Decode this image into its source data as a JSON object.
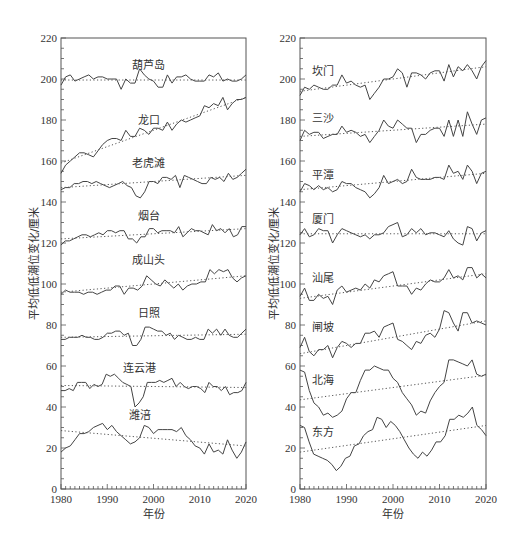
{
  "chart_data": [
    {
      "type": "line",
      "panel": "left",
      "xlabel": "年份",
      "ylabel": "平均低低潮位变化/厘米",
      "xlim": [
        1980,
        2020
      ],
      "ylim": [
        0,
        220
      ],
      "xticks": [
        1980,
        1990,
        2000,
        2010,
        2020
      ],
      "yticks": [
        0,
        20,
        40,
        60,
        80,
        100,
        120,
        140,
        160,
        180,
        200,
        220
      ],
      "grid": false,
      "x": [
        1980,
        1981,
        1982,
        1983,
        1984,
        1985,
        1986,
        1987,
        1988,
        1989,
        1990,
        1991,
        1992,
        1993,
        1994,
        1995,
        1996,
        1997,
        1998,
        1999,
        2000,
        2001,
        2002,
        2003,
        2004,
        2005,
        2006,
        2007,
        2008,
        2009,
        2010,
        2011,
        2012,
        2013,
        2014,
        2015,
        2016,
        2017,
        2018,
        2019,
        2020
      ],
      "series": [
        {
          "name": "葫芦岛",
          "label_pos": [
            1999,
            205
          ],
          "trend": [
            199.5,
            199.5
          ],
          "values": [
            197,
            201,
            202,
            199,
            200,
            201,
            202,
            200,
            201,
            201,
            200,
            200,
            200,
            195,
            200,
            198,
            198,
            205,
            202,
            200,
            199,
            196,
            196,
            202,
            198,
            201,
            201,
            202,
            200,
            199,
            199,
            199,
            202,
            201,
            203,
            199,
            200,
            199,
            199,
            200,
            202
          ]
        },
        {
          "name": "龙口",
          "label_pos": [
            1999,
            178
          ],
          "trend": [
            159,
            191
          ],
          "values": [
            154,
            158,
            160,
            162,
            164,
            164,
            163,
            162,
            165,
            168,
            170,
            171,
            171,
            170,
            175,
            172,
            172,
            176,
            175,
            173,
            176,
            176,
            175,
            179,
            175,
            178,
            180,
            179,
            180,
            181,
            182,
            187,
            186,
            188,
            187,
            191,
            185,
            188,
            190,
            190,
            191
          ]
        },
        {
          "name": "老虎滩",
          "label_pos": [
            1999,
            157
          ],
          "trend": [
            147,
            153
          ],
          "values": [
            146,
            147,
            147,
            149,
            149,
            150,
            150,
            149,
            150,
            149,
            148,
            147,
            148,
            149,
            150,
            148,
            147,
            143,
            142,
            145,
            150,
            150,
            149,
            152,
            152,
            151,
            153,
            147,
            153,
            152,
            151,
            150,
            149,
            149,
            152,
            151,
            152,
            150,
            154,
            151,
            152,
            154,
            156
          ]
        },
        {
          "name": "烟台",
          "label_pos": [
            1999,
            131
          ],
          "trend": [
            122,
            127
          ],
          "values": [
            119,
            121,
            121,
            122,
            123,
            124,
            124,
            123,
            124,
            125,
            124,
            126,
            126,
            125,
            126,
            126,
            122,
            122,
            120,
            123,
            123,
            127,
            127,
            125,
            126,
            126,
            126,
            125,
            128,
            123,
            125,
            127,
            126,
            126,
            125,
            124,
            129,
            126,
            127,
            125,
            127,
            123,
            124,
            128,
            128
          ]
        },
        {
          "name": "成山头",
          "label_pos": [
            1999,
            110
          ],
          "trend": [
            96,
            104
          ],
          "values": [
            95,
            97,
            96,
            96,
            96,
            95,
            96,
            96,
            95,
            96,
            97,
            97,
            99,
            99,
            95,
            98,
            98,
            97,
            99,
            104,
            102,
            100,
            99,
            102,
            100,
            98,
            100,
            97,
            99,
            100,
            100,
            101,
            101,
            107,
            105,
            107,
            106,
            107,
            103,
            101,
            103,
            104
          ]
        },
        {
          "name": "日照",
          "label_pos": [
            1999,
            84
          ],
          "trend": [
            74,
            75.5
          ],
          "values": [
            73,
            73,
            74,
            74,
            74,
            75,
            74,
            74,
            73,
            73,
            74,
            76,
            76,
            77,
            77,
            75,
            76,
            70,
            70,
            73,
            79,
            79,
            78,
            77,
            77,
            75,
            76,
            73,
            75,
            74,
            73,
            73,
            74,
            73,
            73,
            78,
            76,
            78,
            75,
            78,
            75,
            74,
            74,
            76,
            78
          ]
        },
        {
          "name": "连云港",
          "label_pos": [
            1997,
            57
          ],
          "trend": [
            50.5,
            49.5
          ],
          "values": [
            48,
            48,
            49,
            48,
            52,
            52,
            52,
            49,
            51,
            50,
            51,
            56,
            55,
            56,
            54,
            52,
            51,
            50,
            40,
            42,
            45,
            52,
            52,
            52,
            53,
            52,
            53,
            54,
            50,
            52,
            50,
            49,
            50,
            50,
            49,
            47,
            52,
            50,
            50,
            48,
            50,
            46,
            47,
            47,
            48,
            52
          ]
        },
        {
          "name": "潍涪",
          "label_pos": [
            1997,
            34
          ],
          "trend": [
            28.5,
            21
          ],
          "values": [
            18,
            20,
            21,
            24,
            27,
            27,
            28,
            30,
            31,
            32,
            29,
            31,
            28,
            26,
            24,
            22,
            23,
            25,
            31,
            30,
            27,
            29,
            29,
            29,
            29,
            28,
            30,
            26,
            24,
            21,
            20,
            17,
            22,
            18,
            19,
            17,
            24,
            19,
            15,
            18,
            23
          ]
        }
      ]
    },
    {
      "type": "line",
      "panel": "right",
      "xlabel": "年份",
      "ylabel": "平均低低潮位变化/厘米",
      "xlim": [
        1980,
        2020
      ],
      "ylim": [
        0,
        220
      ],
      "xticks": [
        1980,
        1990,
        2000,
        2010,
        2020
      ],
      "yticks": [
        0,
        20,
        40,
        60,
        80,
        100,
        120,
        140,
        160,
        180,
        200,
        220
      ],
      "grid": false,
      "x": [
        1980,
        1981,
        1982,
        1983,
        1984,
        1985,
        1986,
        1987,
        1988,
        1989,
        1990,
        1991,
        1992,
        1993,
        1994,
        1995,
        1996,
        1997,
        1998,
        1999,
        2000,
        2001,
        2002,
        2003,
        2004,
        2005,
        2006,
        2007,
        2008,
        2009,
        2010,
        2011,
        2012,
        2013,
        2014,
        2015,
        2016,
        2017,
        2018,
        2019,
        2020
      ],
      "series": [
        {
          "name": "坎门",
          "label_pos": [
            1985,
            202
          ],
          "trend": [
            194,
            206
          ],
          "values": [
            192,
            196,
            195,
            197,
            196,
            195,
            195,
            197,
            197,
            202,
            198,
            199,
            197,
            196,
            197,
            190,
            193,
            196,
            200,
            200,
            201,
            205,
            203,
            196,
            203,
            203,
            202,
            200,
            203,
            204,
            204,
            199,
            207,
            201,
            206,
            204,
            207,
            204,
            200,
            206,
            209
          ]
        },
        {
          "name": "三沙",
          "label_pos": [
            1985,
            179
          ],
          "trend": [
            172,
            178
          ],
          "values": [
            170,
            175,
            173,
            174,
            174,
            171,
            172,
            173,
            173,
            177,
            174,
            175,
            174,
            172,
            173,
            169,
            172,
            175,
            180,
            177,
            176,
            180,
            178,
            176,
            176,
            169,
            173,
            173,
            175,
            176,
            176,
            172,
            180,
            172,
            180,
            172,
            184,
            178,
            173,
            180,
            181
          ]
        },
        {
          "name": "平潭",
          "label_pos": [
            1985,
            151
          ],
          "trend": [
            146,
            154
          ],
          "values": [
            145,
            149,
            148,
            146,
            148,
            146,
            147,
            145,
            146,
            150,
            149,
            149,
            147,
            146,
            145,
            142,
            144,
            147,
            153,
            149,
            150,
            151,
            149,
            150,
            156,
            152,
            151,
            151,
            151,
            152,
            152,
            151,
            158,
            154,
            155,
            151,
            158,
            155,
            149,
            154,
            155
          ]
        },
        {
          "name": "厦门",
          "label_pos": [
            1985,
            130
          ],
          "trend": [
            124.5,
            124.5
          ],
          "values": [
            124,
            127,
            123,
            124,
            127,
            126,
            126,
            120,
            124,
            127,
            126,
            125,
            124,
            123,
            124,
            122,
            124,
            124,
            125,
            128,
            129,
            130,
            123,
            124,
            127,
            125,
            127,
            124,
            125,
            125,
            124,
            123,
            126,
            122,
            120,
            119,
            128,
            127,
            121,
            125,
            126
          ]
        },
        {
          "name": "汕尾",
          "label_pos": [
            1985,
            101
          ],
          "trend": [
            93,
            105
          ],
          "values": [
            94,
            98,
            92,
            92,
            95,
            93,
            94,
            90,
            97,
            99,
            96,
            97,
            98,
            97,
            100,
            98,
            102,
            101,
            104,
            105,
            106,
            99,
            99,
            99,
            95,
            98,
            97,
            100,
            102,
            101,
            101,
            103,
            107,
            103,
            104,
            102,
            108,
            108,
            103,
            105,
            103
          ]
        },
        {
          "name": "闸坡",
          "label_pos": [
            1985,
            77
          ],
          "trend": [
            66,
            82
          ],
          "values": [
            69,
            74,
            67,
            65,
            68,
            68,
            70,
            64,
            69,
            72,
            71,
            69,
            71,
            71,
            76,
            76,
            77,
            74,
            79,
            80,
            81,
            73,
            72,
            70,
            68,
            72,
            71,
            75,
            76,
            74,
            78,
            87,
            86,
            81,
            77,
            86,
            86,
            81,
            82,
            81,
            80
          ]
        },
        {
          "name": "北海",
          "label_pos": [
            1985,
            51
          ],
          "trend": [
            43.5,
            55.5
          ],
          "values": [
            58,
            57,
            48,
            42,
            40,
            36,
            37,
            35,
            36,
            38,
            44,
            47,
            47,
            53,
            58,
            58,
            60,
            59,
            58,
            58,
            54,
            52,
            47,
            44,
            41,
            36,
            38,
            37,
            43,
            47,
            50,
            52,
            63,
            63,
            62,
            61,
            60,
            63,
            56,
            55,
            56
          ]
        },
        {
          "name": "东方",
          "label_pos": [
            1985,
            26
          ],
          "trend": [
            18,
            31
          ],
          "values": [
            31,
            30,
            23,
            17,
            16,
            15,
            14,
            12,
            9,
            11,
            15,
            16,
            21,
            22,
            26,
            28,
            29,
            35,
            34,
            30,
            33,
            31,
            28,
            24,
            20,
            17,
            15,
            18,
            16,
            19,
            23,
            23,
            26,
            34,
            34,
            36,
            35,
            37,
            40,
            31,
            29,
            26
          ]
        }
      ]
    }
  ]
}
